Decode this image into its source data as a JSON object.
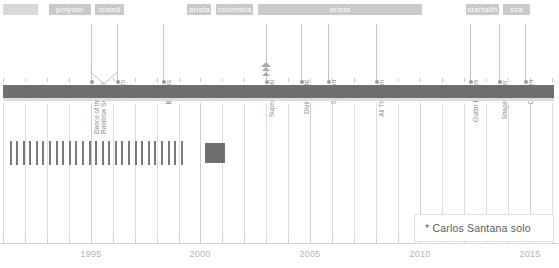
{
  "chart_data": {
    "type": "table",
    "title": "",
    "xlabel": "",
    "ylabel": "",
    "axis": {
      "min_year": 1991.0,
      "max_year": 2016.2,
      "tick_labels": [
        "1995",
        "2000",
        "2005",
        "2010",
        "2015"
      ],
      "tick_years": [
        1995,
        2000,
        2005,
        2010,
        2015
      ],
      "minor_tick_step": 1,
      "grid": true,
      "legend_position": "none"
    },
    "record_labels": [
      {
        "name": "",
        "start_year": 1991.0,
        "end_year": 1992.6,
        "show_text": false
      },
      {
        "name": "polydor",
        "start_year": 1993.1,
        "end_year": 1995.0,
        "show_text": true
      },
      {
        "name": "island",
        "start_year": 1995.2,
        "end_year": 1996.5,
        "show_text": true
      },
      {
        "name": "arista",
        "start_year": 1999.4,
        "end_year": 2000.5,
        "show_text": true
      },
      {
        "name": "columbia",
        "start_year": 2000.7,
        "end_year": 2002.4,
        "show_text": true
      },
      {
        "name": "arista",
        "start_year": 2002.6,
        "end_year": 2010.1,
        "show_text": true
      },
      {
        "name": "starfaith",
        "start_year": 2012.1,
        "end_year": 2013.6,
        "show_text": true
      },
      {
        "name": "sca",
        "start_year": 2013.8,
        "end_year": 2015.0,
        "show_text": true
      }
    ],
    "albums": [
      {
        "title": "Dance of the Rainbow Serpent*",
        "year": 1995.0,
        "multiline": true,
        "marker": "none"
      },
      {
        "title": "Milagro",
        "year": 1996.2,
        "multiline": false,
        "marker": "none"
      },
      {
        "title": "Brothers",
        "year": 1998.3,
        "multiline": false,
        "marker": "none"
      },
      {
        "title": "Supernatural",
        "year": 2003.0,
        "multiline": false,
        "marker": "pyramid"
      },
      {
        "title": "Divine Light",
        "year": 2004.6,
        "multiline": false,
        "marker": "none"
      },
      {
        "title": "Shaman",
        "year": 2005.8,
        "multiline": false,
        "marker": "none"
      },
      {
        "title": "All That I Am",
        "year": 2008.0,
        "multiline": false,
        "marker": "none"
      },
      {
        "title": "Guitar Heaven",
        "year": 2012.3,
        "multiline": false,
        "marker": "none"
      },
      {
        "title": "Shape Shifter",
        "year": 2013.6,
        "multiline": false,
        "marker": "none"
      },
      {
        "title": "Corazón",
        "year": 2014.8,
        "multiline": false,
        "marker": "none"
      }
    ],
    "timeline_band": {
      "start_year": 1991.0,
      "end_year": 2016.1,
      "color": "#6f6f6f"
    },
    "member_marks": {
      "stroke_color": "#7a7a7a",
      "start_year": 1991.3,
      "count": 27,
      "step_year": 0.3,
      "block": {
        "start_year": 2000.2,
        "end_year": 2001.1,
        "color": "#6f6f6f"
      }
    },
    "annotation": {
      "text": "* Carlos Santana solo"
    }
  },
  "colors": {
    "band": "#6f6f6f",
    "label_bar": "#d9d9d9",
    "label_text": "#ffffff",
    "album_text": "#8d8d8d",
    "axis_text": "#b3b3b3",
    "grid": "#dedede",
    "annotation_text": "#5d5d5d"
  }
}
